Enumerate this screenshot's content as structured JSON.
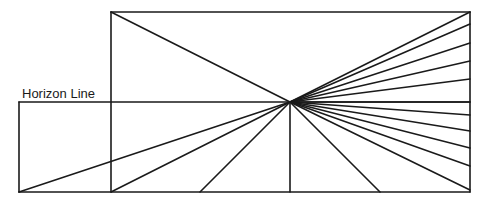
{
  "diagram": {
    "horizon_label": "Horizon Line",
    "stroke_color": "#1a1a1a",
    "background": "#ffffff",
    "vanishing_point": [
      290,
      102
    ],
    "frame": {
      "x1": 111,
      "y1": 12,
      "x2": 470,
      "y2": 192
    },
    "horizon_line": {
      "x1": 19,
      "x2": 470,
      "y": 102
    },
    "left_extension": {
      "x": 19,
      "y1": 102,
      "y2": 192
    },
    "bottom_line": {
      "x1": 19,
      "x2": 470,
      "y": 192
    },
    "rays_to_right_edge_y": [
      12,
      24,
      43,
      61,
      79,
      102,
      115,
      131,
      148,
      166,
      190
    ],
    "rays_to_bottom_x": [
      19,
      111,
      200,
      290,
      380
    ],
    "ray_to_top_left": [
      111,
      12
    ]
  }
}
